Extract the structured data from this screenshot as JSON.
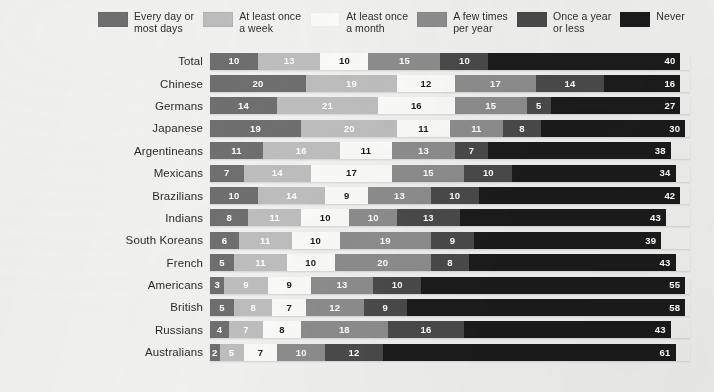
{
  "legend": {
    "items": [
      {
        "label": "Every day or\nmost days",
        "color": "#6f6f6f",
        "icon": "legend-swatch"
      },
      {
        "label": "At least once\na week",
        "color": "#bebebe",
        "icon": "legend-swatch"
      },
      {
        "label": "At least once\na month",
        "color": "#fbfbfa",
        "icon": "legend-swatch"
      },
      {
        "label": "A few times\nper year",
        "color": "#8d8d8d",
        "icon": "legend-swatch"
      },
      {
        "label": "Once a year\nor less",
        "color": "#4a4a4a",
        "icon": "legend-swatch"
      },
      {
        "label": "Never",
        "color": "#1b1b1b",
        "icon": "legend-swatch"
      }
    ]
  },
  "chart_data": {
    "type": "bar",
    "orientation": "horizontal",
    "stacked": true,
    "title": "",
    "xlabel": "",
    "ylabel": "",
    "xlim": [
      0,
      100
    ],
    "grid": false,
    "legend_position": "top",
    "series": [
      {
        "name": "Every day or most days",
        "color": "#6f6f6f",
        "values": [
          10,
          20,
          14,
          19,
          11,
          7,
          10,
          8,
          6,
          5,
          3,
          5,
          4,
          2
        ]
      },
      {
        "name": "At least once a week",
        "color": "#bebebe",
        "values": [
          13,
          19,
          21,
          20,
          16,
          14,
          14,
          11,
          11,
          11,
          9,
          8,
          7,
          5
        ]
      },
      {
        "name": "At least once a month",
        "color": "#fbfbfa",
        "values": [
          10,
          12,
          16,
          11,
          11,
          17,
          9,
          10,
          10,
          10,
          9,
          7,
          8,
          7
        ]
      },
      {
        "name": "A few times per year",
        "color": "#8d8d8d",
        "values": [
          15,
          17,
          15,
          11,
          13,
          15,
          13,
          10,
          19,
          20,
          13,
          12,
          18,
          10
        ]
      },
      {
        "name": "Once a year or less",
        "color": "#4a4a4a",
        "values": [
          10,
          14,
          5,
          8,
          7,
          10,
          10,
          13,
          9,
          8,
          10,
          9,
          16,
          12
        ]
      },
      {
        "name": "Never",
        "color": "#1b1b1b",
        "values": [
          40,
          16,
          27,
          30,
          38,
          34,
          42,
          43,
          39,
          43,
          55,
          58,
          43,
          61
        ]
      }
    ],
    "categories": [
      "Total",
      "Chinese",
      "Germans",
      "Japanese",
      "Argentineans",
      "Mexicans",
      "Brazilians",
      "Indians",
      "South Koreans",
      "French",
      "Americans",
      "British",
      "Russians",
      "Australians"
    ]
  }
}
